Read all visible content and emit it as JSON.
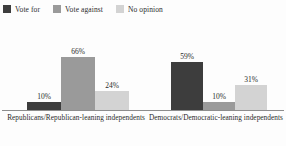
{
  "chart_data": {
    "type": "bar",
    "title": "",
    "subtitle": "",
    "xlabel": "",
    "ylabel": "",
    "ylim": [
      0,
      100
    ],
    "grid": false,
    "legend_position": "top-left",
    "categories": [
      "Republicans/Republican-leaning independents",
      "Democrats/Democratic-leaning independents"
    ],
    "series": [
      {
        "name": "Vote for",
        "color": "#3d3d3d",
        "values": [
          10,
          59
        ],
        "labels": [
          "10%",
          "59%"
        ]
      },
      {
        "name": "Vote against",
        "color": "#9a9a9a",
        "values": [
          66,
          10
        ],
        "labels": [
          "66%",
          "10%"
        ]
      },
      {
        "name": "No opinion",
        "color": "#d3d3d3",
        "values": [
          24,
          31
        ],
        "labels": [
          "24%",
          "31%"
        ]
      }
    ]
  },
  "legend": {
    "items": [
      {
        "label": "Vote for",
        "swatch_color": "#3d3d3d"
      },
      {
        "label": "Vote against",
        "swatch_color": "#9a9a9a"
      },
      {
        "label": "No opinion",
        "swatch_color": "#d3d3d3"
      }
    ]
  },
  "axis": {
    "baseline_color": "#8d8d8d"
  },
  "groups": [
    {
      "label": "Republicans/Republican-leaning independents",
      "bars": [
        {
          "series": "Vote for",
          "value": 10,
          "label": "10%",
          "color": "#3d3d3d"
        },
        {
          "series": "Vote against",
          "value": 66,
          "label": "66%",
          "color": "#9a9a9a"
        },
        {
          "series": "No opinion",
          "value": 24,
          "label": "24%",
          "color": "#d3d3d3"
        }
      ]
    },
    {
      "label": "Democrats/Democratic-leaning independents",
      "bars": [
        {
          "series": "Vote for",
          "value": 59,
          "label": "59%",
          "color": "#3d3d3d"
        },
        {
          "series": "Vote against",
          "value": 10,
          "label": "10%",
          "color": "#9a9a9a"
        },
        {
          "series": "No opinion",
          "value": 31,
          "label": "31%",
          "color": "#d3d3d3"
        }
      ]
    }
  ]
}
